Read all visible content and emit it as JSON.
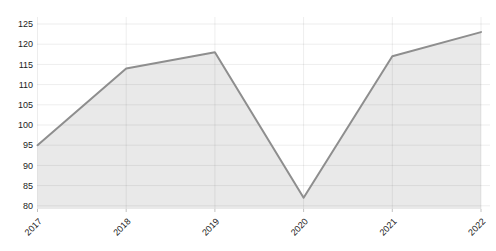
{
  "chart_data": {
    "type": "area",
    "x": [
      "2017",
      "2018",
      "2019",
      "2020",
      "2021",
      "2022"
    ],
    "values": [
      95,
      114,
      118,
      82,
      117,
      123
    ],
    "title": "",
    "xlabel": "",
    "ylabel": "",
    "ylim": [
      80,
      125
    ],
    "ytick_step": 5,
    "yticks": [
      80,
      85,
      90,
      95,
      100,
      105,
      110,
      115,
      120,
      125
    ],
    "grid": true,
    "legend": false,
    "x_label_rotation_deg": 45,
    "colors": {
      "background": "#ffffff",
      "fill": "#e9e9e9",
      "line": "#8e8e8e",
      "grid": "#000000",
      "grid_opacity": 0.07,
      "tick_label": "#1c1c1c",
      "tick_mark": "#9a9a9a"
    }
  }
}
